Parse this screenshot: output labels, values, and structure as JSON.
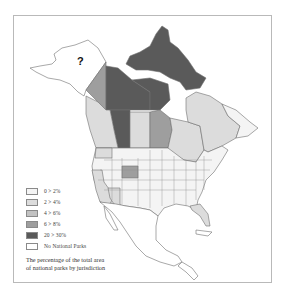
{
  "map": {
    "title": "The percentage of the total area of national parks by jurisdiction",
    "unknown_marker": "?",
    "unknown_region": "Alaska",
    "colors": {
      "c0_2": "#f4f4f4",
      "c2_4": "#dcdcdc",
      "c4_6": "#c2c2c2",
      "c6_8": "#9e9e9e",
      "c20_30": "#5a5a5a",
      "none": "#ffffff",
      "border": "#6f6f6f"
    },
    "regions": [
      {
        "name": "Nunavut",
        "class": "20 > 30%"
      },
      {
        "name": "Northwest Territories",
        "class": "20 > 30%"
      },
      {
        "name": "Alberta",
        "class": "20 > 30%"
      },
      {
        "name": "Yukon",
        "class": "6 > 8%"
      },
      {
        "name": "Manitoba",
        "class": "6 > 8%"
      },
      {
        "name": "Saskatchewan",
        "class": "2 > 4%"
      },
      {
        "name": "British Columbia",
        "class": "2 > 4%"
      },
      {
        "name": "Ontario",
        "class": "2 > 4%"
      },
      {
        "name": "Quebec",
        "class": "2 > 4%"
      },
      {
        "name": "Wyoming",
        "class": "6 > 8%"
      },
      {
        "name": "Washington",
        "class": "2 > 4%"
      },
      {
        "name": "California",
        "class": "2 > 4%"
      },
      {
        "name": "Arizona",
        "class": "2 > 4%"
      },
      {
        "name": "Florida",
        "class": "2 > 4%"
      },
      {
        "name": "Alaska",
        "class": "unknown"
      }
    ]
  },
  "legend": {
    "items": [
      {
        "label": "0 > 2%",
        "color": "#f4f4f4"
      },
      {
        "label": "2 > 4%",
        "color": "#dcdcdc"
      },
      {
        "label": "4 > 6%",
        "color": "#c2c2c2"
      },
      {
        "label": "6 > 8%",
        "color": "#9e9e9e"
      },
      {
        "label": "20 > 30%",
        "color": "#5a5a5a"
      },
      {
        "label": "No National Parks",
        "color": "#ffffff"
      }
    ]
  },
  "caption": {
    "line1": "The percentage of the total area",
    "line2": "of national parks by jurisdiction"
  }
}
